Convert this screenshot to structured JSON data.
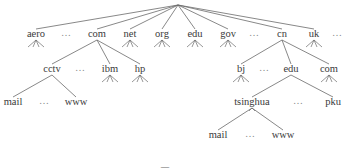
{
  "diagram": {
    "type": "domain-name-tree",
    "root": {
      "x": 178,
      "y": 5
    },
    "tld": [
      {
        "label": "aero",
        "x": 36,
        "y": 36,
        "stubs": true
      },
      {
        "label": "…",
        "x": 66,
        "y": 36,
        "ellipsis": true
      },
      {
        "label": "com",
        "x": 97,
        "y": 36,
        "stubs": false
      },
      {
        "label": "net",
        "x": 130,
        "y": 36,
        "stubs": true
      },
      {
        "label": "org",
        "x": 162,
        "y": 36,
        "stubs": true
      },
      {
        "label": "edu",
        "x": 195,
        "y": 36,
        "stubs": true
      },
      {
        "label": "gov",
        "x": 228,
        "y": 36,
        "stubs": true
      },
      {
        "label": "…",
        "x": 254,
        "y": 36,
        "ellipsis": true
      },
      {
        "label": "cn",
        "x": 282,
        "y": 36,
        "stubs": false
      },
      {
        "label": "uk",
        "x": 314,
        "y": 36,
        "stubs": true
      },
      {
        "label": "…",
        "x": 337,
        "y": 36,
        "ellipsis": true
      }
    ],
    "second_level": [
      {
        "label": "cctv",
        "x": 52,
        "y": 71,
        "parent": "com",
        "stubs": false
      },
      {
        "label": "…",
        "x": 80,
        "y": 71,
        "ellipsis": true
      },
      {
        "label": "ibm",
        "x": 110,
        "y": 71,
        "parent": "com",
        "stubs": true
      },
      {
        "label": "hp",
        "x": 140,
        "y": 71,
        "parent": "com",
        "stubs": true
      },
      {
        "label": "bj",
        "x": 241,
        "y": 71,
        "parent": "cn",
        "stubs": true
      },
      {
        "label": "…",
        "x": 264,
        "y": 71,
        "ellipsis": true
      },
      {
        "label": "edu",
        "x": 291,
        "y": 71,
        "parent": "cn",
        "stubs": false
      },
      {
        "label": "com",
        "x": 329,
        "y": 71,
        "parent": "cn",
        "stubs": true
      }
    ],
    "third_level": [
      {
        "label": "mail",
        "x": 13,
        "y": 104,
        "parent": "cctv"
      },
      {
        "label": "…",
        "x": 44,
        "y": 104,
        "ellipsis": true
      },
      {
        "label": "www",
        "x": 76,
        "y": 104,
        "parent": "cctv"
      },
      {
        "label": "tsinghua",
        "x": 252,
        "y": 104,
        "parent": "edu.cn",
        "stubs": false
      },
      {
        "label": "…",
        "x": 298,
        "y": 104,
        "ellipsis": true
      },
      {
        "label": "pku",
        "x": 333,
        "y": 104,
        "parent": "edu.cn"
      }
    ],
    "fourth_level": [
      {
        "label": "mail",
        "x": 218,
        "y": 137,
        "parent": "tsinghua"
      },
      {
        "label": "…",
        "x": 250,
        "y": 137,
        "ellipsis": true
      },
      {
        "label": "www",
        "x": 283,
        "y": 137,
        "parent": "tsinghua"
      }
    ]
  },
  "caption": {
    "visible_fragment": "图 …"
  }
}
